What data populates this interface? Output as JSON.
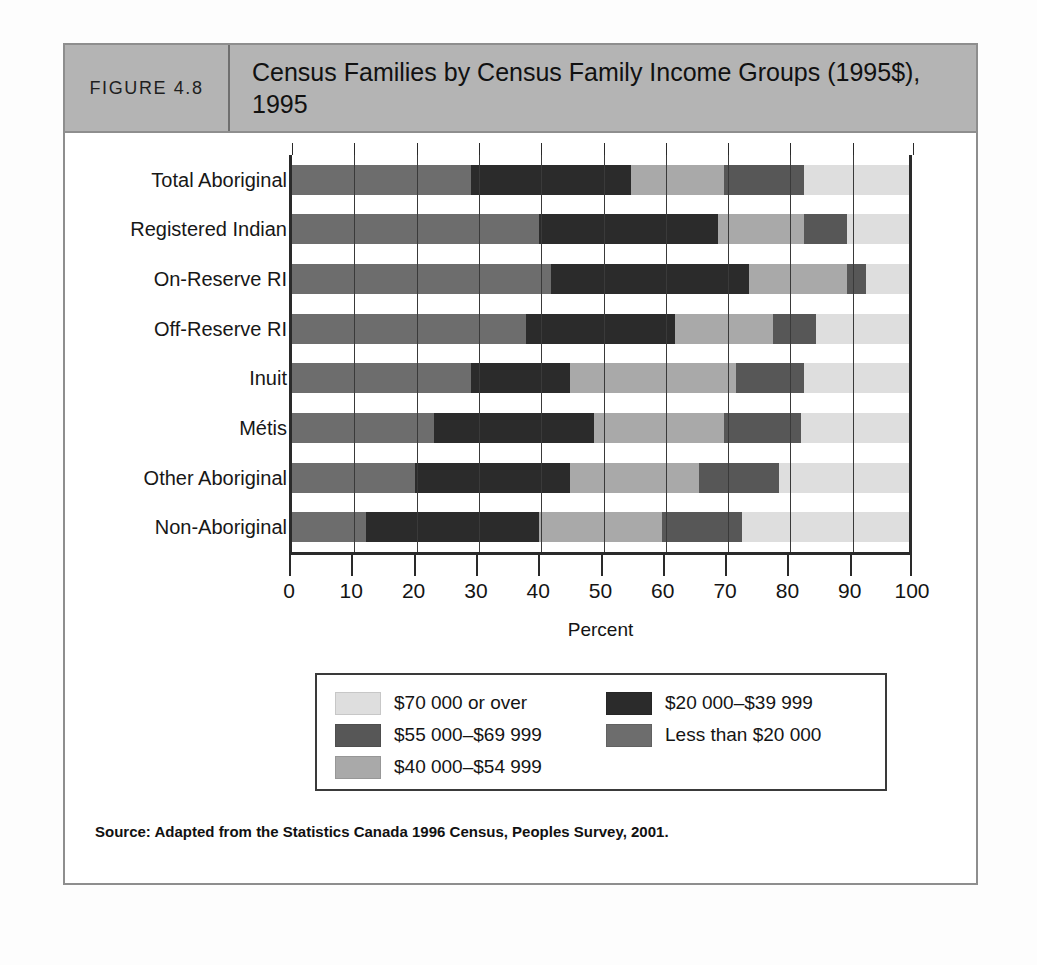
{
  "figure": {
    "number_label": "FIGURE 4.8",
    "title": "Census Families by Census Family Income Groups (1995$), 1995",
    "source": "Source: Adapted from the Statistics Canada 1996 Census, Peoples Survey, 2001."
  },
  "chart_data": {
    "type": "bar",
    "orientation": "horizontal",
    "stacked": true,
    "normalized": true,
    "title": "Census Families by Census Family Income Groups (1995$), 1995",
    "xlabel": "Percent",
    "ylabel": "",
    "xlim": [
      0,
      100
    ],
    "xticks": [
      0,
      10,
      20,
      30,
      40,
      50,
      60,
      70,
      80,
      90,
      100
    ],
    "grid": true,
    "legend_position": "bottom",
    "categories": [
      "Total Aboriginal",
      "Registered Indian",
      "On-Reserve RI",
      "Off-Reserve RI",
      "Inuit",
      "Métis",
      "Other Aboriginal",
      "Non-Aboriginal"
    ],
    "series": [
      {
        "name": "Less than $20 000",
        "color": "#6d6d6d",
        "values": [
          29,
          40,
          42,
          38,
          29,
          23,
          20,
          12
        ]
      },
      {
        "name": "$20 000–$39 999",
        "color": "#2b2b2b",
        "values": [
          26,
          29,
          32,
          24,
          16,
          26,
          25,
          28
        ]
      },
      {
        "name": "$40 000–$54 999",
        "color": "#a9a9a9",
        "values": [
          15,
          14,
          16,
          16,
          27,
          21,
          21,
          20
        ]
      },
      {
        "name": "$55 000–$69 999",
        "color": "#575757",
        "values": [
          13,
          7,
          3,
          7,
          11,
          12.5,
          13,
          13
        ]
      },
      {
        "name": "$70 000 or over",
        "color": "#dedede",
        "values": [
          17,
          10,
          7,
          15,
          17,
          17.5,
          21,
          27
        ]
      }
    ],
    "legend_entries": [
      {
        "label": "$70 000 or over",
        "color": "#dedede"
      },
      {
        "label": "$20 000–$39 999",
        "color": "#2b2b2b"
      },
      {
        "label": "$55 000–$69 999",
        "color": "#575757"
      },
      {
        "label": "Less than $20 000",
        "color": "#a9a9a9"
      },
      {
        "label": "$40 000–$54 999",
        "color": "#a9a9a9"
      }
    ]
  }
}
